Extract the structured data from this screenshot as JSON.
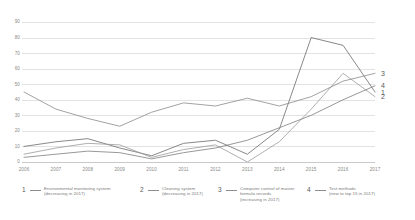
{
  "chart_data": {
    "type": "line",
    "title": "",
    "xlabel": "",
    "ylabel": "",
    "ylim": [
      0,
      90
    ],
    "ytick_step": 10,
    "grid": true,
    "legend_position": "bottom",
    "categories": [
      "2006",
      "2007",
      "2008",
      "2009",
      "2010",
      "2011",
      "2012",
      "2013",
      "2014",
      "2015",
      "2016",
      "2017"
    ],
    "yticks": [
      "0",
      "10",
      "20",
      "30",
      "40",
      "50",
      "60",
      "70",
      "80",
      "90"
    ],
    "series": [
      {
        "name": "Environmental monitoring system",
        "key": "1",
        "note": "(decreasing in 2017)",
        "color": "#6b6b6b",
        "end_label": "1",
        "values": [
          10,
          13,
          15,
          9,
          4,
          12,
          14,
          5,
          21,
          80,
          75,
          45
        ]
      },
      {
        "name": "Cleaning system",
        "key": "2",
        "note": "(decreasing in 2017)",
        "color": "#9a9a9a",
        "end_label": "2",
        "values": [
          5,
          9,
          12,
          11,
          3,
          8,
          11,
          0,
          13,
          34,
          57,
          42
        ]
      },
      {
        "name": "Computer control of master formula records",
        "key": "3",
        "note": "(increasing in 2017)",
        "color": "#8a8a8a",
        "end_label": "3",
        "values": [
          45,
          34,
          28,
          23,
          32,
          38,
          36,
          41,
          36,
          42,
          52,
          57
        ]
      },
      {
        "name": "Test methods",
        "key": "4",
        "note": "(new to top 15 in 2017)",
        "color": "#7d7d7d",
        "end_label": "4",
        "values": [
          3,
          5,
          7,
          6,
          2,
          6,
          9,
          14,
          22,
          30,
          40,
          49
        ]
      }
    ]
  },
  "legend": {
    "items": [
      {
        "num": "1",
        "line1": "Environmental monitoring system",
        "line2": "(decreasing in 2017)"
      },
      {
        "num": "2",
        "line1": "Cleaning system",
        "line2": "(decreasing in 2017)"
      },
      {
        "num": "3",
        "line1": "Computer control of master",
        "line2": "formula records",
        "line3": "(increasing in 2017)"
      },
      {
        "num": "4",
        "line1": "Test methods",
        "line2": "(new to top 15 in 2017)"
      }
    ]
  },
  "colors": {
    "grid": "#e3e3e3",
    "axis": "#c9c9c9",
    "text": "#8a8a8a",
    "series_dark": "#6b6b6b",
    "series_light": "#9a9a9a"
  }
}
